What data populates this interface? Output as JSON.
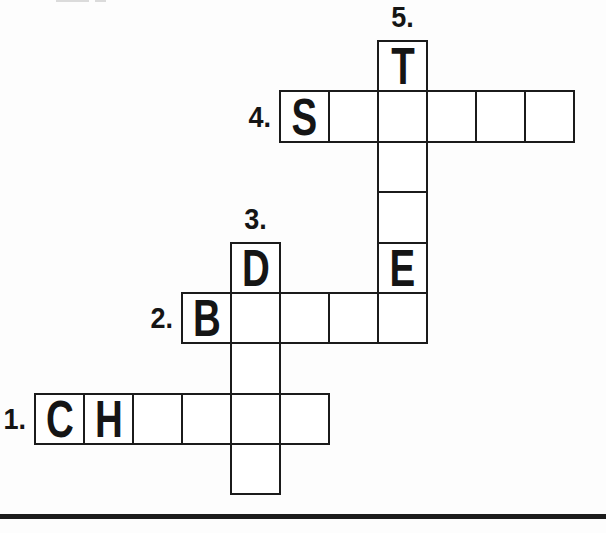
{
  "page": {
    "background_color": "#ffffff",
    "ink_color": "#1b1b1b",
    "divider_color": "#1c1c1c"
  },
  "puzzle": {
    "type": "crossword",
    "grid_rows": 9,
    "grid_cols": 11,
    "words": [
      {
        "number": "1.",
        "direction": "across",
        "row": 7,
        "col": 0,
        "length": 6,
        "prefilled": [
          {
            "index": 0,
            "letter": "C"
          },
          {
            "index": 1,
            "letter": "H"
          }
        ]
      },
      {
        "number": "2.",
        "direction": "across",
        "row": 5,
        "col": 3,
        "length": 5,
        "prefilled": [
          {
            "index": 0,
            "letter": "B"
          }
        ]
      },
      {
        "number": "3.",
        "direction": "down",
        "row": 4,
        "col": 4,
        "length": 5,
        "prefilled": [
          {
            "index": 0,
            "letter": "D"
          }
        ]
      },
      {
        "number": "4.",
        "direction": "across",
        "row": 1,
        "col": 5,
        "length": 6,
        "prefilled": [
          {
            "index": 0,
            "letter": "S"
          }
        ]
      },
      {
        "number": "5.",
        "direction": "down",
        "row": 0,
        "col": 7,
        "length": 6,
        "prefilled": [
          {
            "index": 0,
            "letter": "T"
          },
          {
            "index": 4,
            "letter": "E"
          }
        ]
      }
    ]
  }
}
